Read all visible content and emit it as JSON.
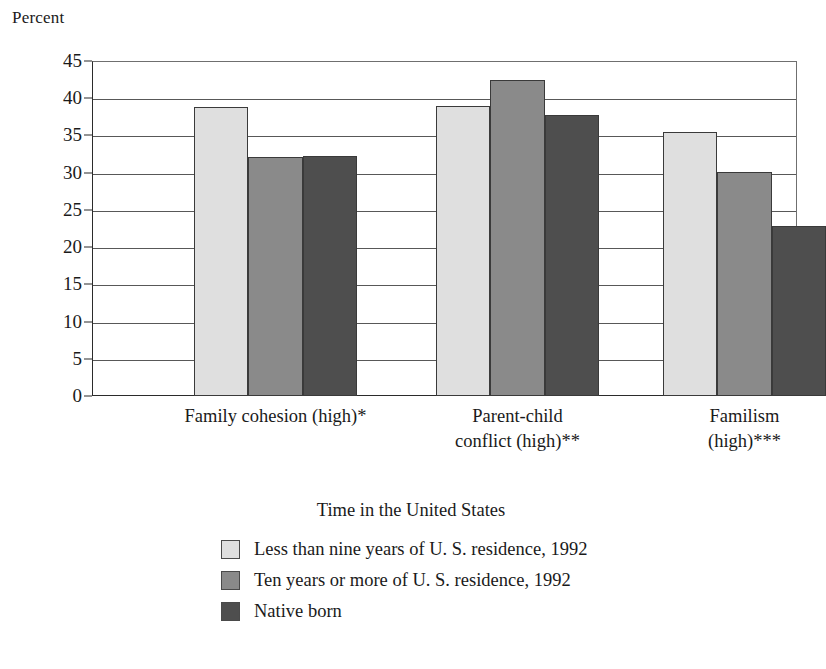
{
  "chart_data": {
    "type": "bar",
    "title": "",
    "xlabel": "",
    "ylabel": "Percent",
    "ylim": [
      0,
      45
    ],
    "ytick_step": 5,
    "yticks": [
      45,
      40,
      35,
      30,
      25,
      20,
      15,
      10,
      5,
      0
    ],
    "grid": true,
    "grouped": true,
    "bar_gap_within_group": 0,
    "categories": [
      "Family cohesion (high)*",
      "Parent-child\nconflict (high)**",
      "Familism (high)***"
    ],
    "series": [
      {
        "name": "Less than nine years of U. S. residence, 1992",
        "color": "#dfdfdf",
        "values": [
          38.8,
          39.0,
          35.5
        ]
      },
      {
        "name": "Ten years or more of U. S. residence, 1992",
        "color": "#8a8a8a",
        "values": [
          32.1,
          42.5,
          30.1
        ]
      },
      {
        "name": "Native born",
        "color": "#4e4e4e",
        "values": [
          32.3,
          37.7,
          22.9
        ]
      }
    ],
    "legend": {
      "position": "bottom",
      "title": "Time in the United States",
      "entries": [
        "Less than nine years of U. S. residence, 1992",
        "Ten years or more of U. S. residence, 1992",
        "Native born"
      ]
    }
  }
}
